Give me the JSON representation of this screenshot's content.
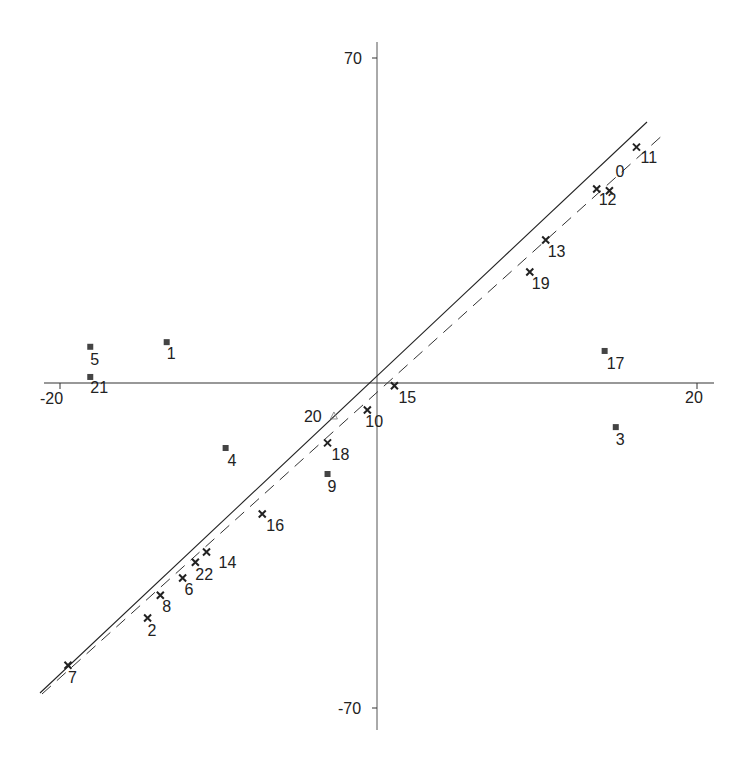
{
  "chart_data": {
    "type": "scatter",
    "title": "",
    "xlabel": "",
    "ylabel": "",
    "xlim": [
      -20,
      20
    ],
    "ylim": [
      -70,
      70
    ],
    "grid": false,
    "legend": null,
    "x_ticks": [
      "-20",
      "20"
    ],
    "y_ticks": [
      "70",
      "-70"
    ],
    "series": [
      {
        "name": "cross",
        "marker": "x",
        "points": [
          {
            "label": "0",
            "x": 14.5,
            "y": 41.4
          },
          {
            "label": "2",
            "x": -14.5,
            "y": -50.6
          },
          {
            "label": "6",
            "x": -12.3,
            "y": -42.0
          },
          {
            "label": "7",
            "x": -19.5,
            "y": -60.8
          },
          {
            "label": "8",
            "x": -13.7,
            "y": -45.7
          },
          {
            "label": "10",
            "x": -0.7,
            "y": -5.8
          },
          {
            "label": "11",
            "x": 16.2,
            "y": 50.8
          },
          {
            "label": "12",
            "x": 13.7,
            "y": 41.8
          },
          {
            "label": "13",
            "x": 10.5,
            "y": 30.8
          },
          {
            "label": "14",
            "x": -10.8,
            "y": -36.4
          },
          {
            "label": "15",
            "x": 1.0,
            "y": -0.6
          },
          {
            "label": "16",
            "x": -7.3,
            "y": -28.2
          },
          {
            "label": "18",
            "x": -3.2,
            "y": -12.9
          },
          {
            "label": "19",
            "x": 9.5,
            "y": 23.9
          },
          {
            "label": "22",
            "x": -11.5,
            "y": -38.6
          }
        ]
      },
      {
        "name": "square",
        "marker": "square",
        "points": [
          {
            "label": "1",
            "x": -13.3,
            "y": 8.8
          },
          {
            "label": "3",
            "x": 14.9,
            "y": -9.5
          },
          {
            "label": "4",
            "x": -9.6,
            "y": -14.0
          },
          {
            "label": "5",
            "x": -18.1,
            "y": 7.8
          },
          {
            "label": "9",
            "x": -3.2,
            "y": -19.6
          },
          {
            "label": "17",
            "x": 14.2,
            "y": 6.9
          },
          {
            "label": "21",
            "x": -18.1,
            "y": 1.3
          }
        ]
      },
      {
        "name": "triangle",
        "marker": "triangle",
        "points": [
          {
            "label": "20",
            "x": -2.8,
            "y": -7.1
          }
        ]
      }
    ],
    "lines": [
      {
        "name": "fit-solid",
        "style": "solid",
        "from": [
          -21.4,
          66.7
        ],
        "to": [
          16.9,
          -56.3
        ]
      },
      {
        "name": "fit-dashed",
        "style": "dashed",
        "from": [
          -21.1,
          66.9
        ],
        "to": [
          18.0,
          -54.0
        ]
      }
    ]
  },
  "labels": {
    "x_min": "-20",
    "x_max": "20",
    "y_max": "70",
    "y_min": "-70"
  },
  "colors": {
    "axis": "#333333",
    "marker": "#222222",
    "text": "#222222",
    "background": "#ffffff"
  }
}
